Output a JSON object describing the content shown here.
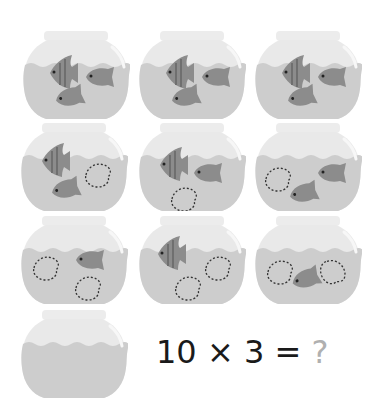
{
  "colors": {
    "glass": "#e9e9e9",
    "glass_edge": "#dedede",
    "water": "#cdcdcd",
    "fish": "#8c8c8c",
    "fish_stripe": "#6f6f6f",
    "dashed_outline": "#333333",
    "question_mark": "#b0b0b0"
  },
  "bowls": [
    {
      "row": 1,
      "col": 1,
      "fish_filled": 3,
      "fish_outlined": 0
    },
    {
      "row": 1,
      "col": 2,
      "fish_filled": 3,
      "fish_outlined": 0
    },
    {
      "row": 1,
      "col": 3,
      "fish_filled": 3,
      "fish_outlined": 0
    },
    {
      "row": 2,
      "col": 1,
      "fish_filled": 2,
      "fish_outlined": 1
    },
    {
      "row": 2,
      "col": 2,
      "fish_filled": 2,
      "fish_outlined": 1
    },
    {
      "row": 2,
      "col": 3,
      "fish_filled": 2,
      "fish_outlined": 1
    },
    {
      "row": 3,
      "col": 1,
      "fish_filled": 1,
      "fish_outlined": 2
    },
    {
      "row": 3,
      "col": 2,
      "fish_filled": 1,
      "fish_outlined": 2
    },
    {
      "row": 3,
      "col": 3,
      "fish_filled": 1,
      "fish_outlined": 2
    },
    {
      "row": 4,
      "col": 1,
      "fish_filled": 0,
      "fish_outlined": 0
    }
  ],
  "equation": {
    "left": "10",
    "operator": "×",
    "right": "3",
    "equals": "=",
    "answer": "?"
  }
}
